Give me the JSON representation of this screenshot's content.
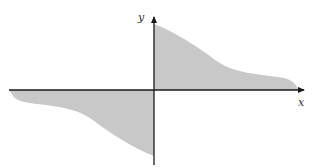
{
  "diagram": {
    "type": "odd-function-area-plot",
    "axes": {
      "x_label": "x",
      "y_label": "y"
    },
    "colors": {
      "fill": "#c8c8c8",
      "axis": "#1a1a1a",
      "background": "#ffffff"
    },
    "regions": [
      {
        "name": "upper-right-area",
        "quadrant": "I"
      },
      {
        "name": "lower-left-area",
        "quadrant": "III"
      }
    ]
  }
}
